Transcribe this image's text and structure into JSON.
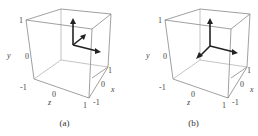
{
  "figure": {
    "panels": [
      {
        "caption": "(a)",
        "axis_labels": {
          "y": "y",
          "z": "z",
          "x": "x"
        },
        "ticks": {
          "y_top": "1",
          "y_mid": "0",
          "y_bot": "-1",
          "z_mid": "0",
          "z_end": "1",
          "x_start": "-1",
          "x_mid": "0",
          "x_end": "1"
        },
        "arrows": [
          "up",
          "right",
          "diagonal-back"
        ]
      },
      {
        "caption": "(b)",
        "axis_labels": {
          "y": "y",
          "z": "z",
          "x": "x"
        },
        "ticks": {
          "y_top": "1",
          "y_mid": "0",
          "y_bot": "-1",
          "z_mid": "0",
          "z_end": "1",
          "x_start": "-1",
          "x_mid": "0",
          "x_end": "1"
        },
        "arrows": [
          "up",
          "right",
          "diagonal-front"
        ]
      }
    ]
  }
}
